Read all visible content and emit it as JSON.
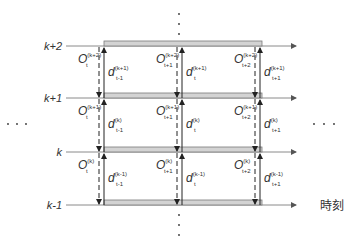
{
  "diagram": {
    "time_axis_label": "時刻",
    "row_labels": [
      "k+2",
      "k+1",
      "k",
      "k-1"
    ],
    "ellipsis": "· · ·",
    "colors": {
      "line": "#8a8a8a",
      "band_fill": "#d3d3d3",
      "band_stroke": "#7a7a7a",
      "arrow": "#222222",
      "text": "#333333"
    },
    "o_labels": [
      {
        "base": "O",
        "sub": "t",
        "sup": "(k+2)"
      },
      {
        "base": "O",
        "sub": "t+1",
        "sup": "(k+2)"
      },
      {
        "base": "O",
        "sub": "t+2",
        "sup": "(k+2)"
      },
      {
        "base": "O",
        "sub": "t",
        "sup": "(k+1)"
      },
      {
        "base": "O",
        "sub": "t+1",
        "sup": "(k+1)"
      },
      {
        "base": "O",
        "sub": "t+2",
        "sup": "(k+1)"
      },
      {
        "base": "O",
        "sub": "t",
        "sup": "(k)"
      },
      {
        "base": "O",
        "sub": "t+1",
        "sup": "(k)"
      },
      {
        "base": "O",
        "sub": "t+2",
        "sup": "(k)"
      }
    ],
    "d_labels": [
      {
        "base": "d",
        "sub": "t-1",
        "sup": "(k+1)"
      },
      {
        "base": "d",
        "sub": "t",
        "sup": "(k+1)"
      },
      {
        "base": "d",
        "sub": "t+1",
        "sup": "(k+1)"
      },
      {
        "base": "d",
        "sub": "t-1",
        "sup": "(k)"
      },
      {
        "base": "d",
        "sub": "t",
        "sup": "(k)"
      },
      {
        "base": "d",
        "sub": "t+1",
        "sup": "(k)"
      },
      {
        "base": "d",
        "sub": "t-1",
        "sup": "(k-1)"
      },
      {
        "base": "d",
        "sub": "t",
        "sup": "(k-1)"
      },
      {
        "base": "d",
        "sub": "t+1",
        "sup": "(k-1)"
      }
    ]
  }
}
